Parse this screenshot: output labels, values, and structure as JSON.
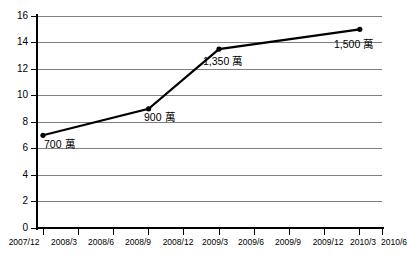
{
  "chart_data": {
    "type": "line",
    "title": "",
    "subtitle": "",
    "xlabel": "",
    "ylabel": "",
    "grid": true,
    "legend": "none",
    "ylim": [
      0,
      16
    ],
    "ytick_step": 2,
    "yticks": [
      "0",
      "2",
      "4",
      "6",
      "8",
      "10",
      "12",
      "14",
      "16"
    ],
    "categories": [
      "2007/12",
      "2008/3",
      "2008/6",
      "2008/9",
      "2008/12",
      "2009/3",
      "2009/6",
      "2009/9",
      "2009/12",
      "2010/3",
      "2010/6"
    ],
    "series": [
      {
        "name": "",
        "color": "#000000",
        "points": [
          {
            "category": "2007/12",
            "x": 0,
            "y": 7,
            "label": "700 萬",
            "label_number": "700",
            "label_unit": "萬"
          },
          {
            "category": "2008/9",
            "x": 3,
            "y": 9,
            "label": "900 萬",
            "label_number": "900",
            "label_unit": "萬"
          },
          {
            "category": "2009/3",
            "x": 5,
            "y": 13.5,
            "label": "1,350 萬",
            "label_number": "1,350",
            "label_unit": "萬"
          },
          {
            "category": "2010/3",
            "x": 9,
            "y": 15,
            "label": "1,500 萬",
            "label_number": "1,500",
            "label_unit": "萬"
          }
        ]
      }
    ],
    "colors": {
      "line": "#000000",
      "marker": "#000000",
      "gridline": "#808080",
      "axis": "#000000",
      "background": "#ffffff",
      "text": "#000000"
    }
  }
}
